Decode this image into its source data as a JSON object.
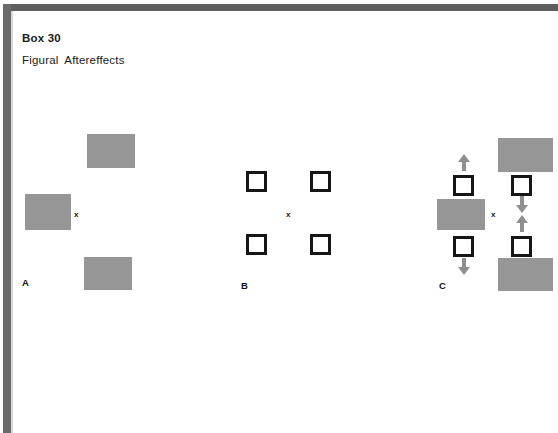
{
  "page": {
    "box_number": "Box 30",
    "title": "Figural  Aftereffects",
    "width": 558,
    "height": 433,
    "background_color": "#ffffff",
    "border_color": "#5e5e5e"
  },
  "colors": {
    "gray_fill": "#969696",
    "square_stroke": "#161616",
    "arrow_fill": "#8f8f8f",
    "text": "#1a1a1a"
  },
  "panels": [
    {
      "id": "A",
      "label": "A",
      "label_pos": {
        "x": 22,
        "y": 278
      },
      "fixation": {
        "mark": "x",
        "x": 74,
        "y": 211
      },
      "gray_rects": [
        {
          "name": "inspection-rect-top",
          "x": 87,
          "y": 134,
          "w": 48,
          "h": 34
        },
        {
          "name": "inspection-rect-middle-left",
          "x": 25,
          "y": 194,
          "w": 46,
          "h": 36
        },
        {
          "name": "inspection-rect-bottom",
          "x": 84,
          "y": 257,
          "w": 48,
          "h": 33
        }
      ],
      "squares": [],
      "arrows": []
    },
    {
      "id": "B",
      "label": "B",
      "label_pos": {
        "x": 241,
        "y": 281
      },
      "fixation": {
        "mark": "x",
        "x": 286,
        "y": 211
      },
      "gray_rects": [],
      "squares": [
        {
          "name": "test-square-top-left",
          "x": 246,
          "y": 171,
          "w": 21,
          "h": 21
        },
        {
          "name": "test-square-top-right",
          "x": 310,
          "y": 171,
          "w": 21,
          "h": 21
        },
        {
          "name": "test-square-bottom-left",
          "x": 246,
          "y": 234,
          "w": 21,
          "h": 21
        },
        {
          "name": "test-square-bottom-right",
          "x": 310,
          "y": 234,
          "w": 21,
          "h": 21
        }
      ],
      "arrows": []
    },
    {
      "id": "C",
      "label": "C",
      "label_pos": {
        "x": 439,
        "y": 281
      },
      "fixation": {
        "mark": "x",
        "x": 491,
        "y": 211
      },
      "gray_rects": [
        {
          "name": "inducing-rect-right-top",
          "x": 498,
          "y": 138,
          "w": 55,
          "h": 34
        },
        {
          "name": "inducing-rect-left-middle",
          "x": 437,
          "y": 199,
          "w": 48,
          "h": 31
        },
        {
          "name": "inducing-rect-right-bottom",
          "x": 498,
          "y": 258,
          "w": 55,
          "h": 33
        }
      ],
      "squares": [
        {
          "name": "displaced-square-left-top",
          "x": 453,
          "y": 175,
          "w": 21,
          "h": 21
        },
        {
          "name": "displaced-square-right-top",
          "x": 511,
          "y": 175,
          "w": 21,
          "h": 21
        },
        {
          "name": "displaced-square-left-bottom",
          "x": 453,
          "y": 236,
          "w": 21,
          "h": 21
        },
        {
          "name": "displaced-square-right-bottom",
          "x": 511,
          "y": 236,
          "w": 21,
          "h": 21
        }
      ],
      "arrows": [
        {
          "name": "displacement-arrow-left-top",
          "direction": "up",
          "x": 457,
          "y": 154
        },
        {
          "name": "displacement-arrow-left-bottom",
          "direction": "down",
          "x": 457,
          "y": 258
        },
        {
          "name": "displacement-arrow-right-top",
          "direction": "down",
          "x": 515,
          "y": 196
        },
        {
          "name": "displacement-arrow-right-bottom",
          "direction": "up",
          "x": 515,
          "y": 215
        }
      ]
    }
  ]
}
